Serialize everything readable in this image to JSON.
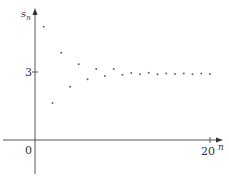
{
  "chart_data": {
    "type": "scatter",
    "title": "",
    "xlabel": "n",
    "ylabel": "s_n",
    "ylabel_main": "s",
    "ylabel_sub": "n",
    "x_ticks": [
      {
        "value": 0,
        "label": "0"
      },
      {
        "value": 20,
        "label": "20"
      }
    ],
    "y_ticks": [
      {
        "value": 3,
        "label": "3"
      }
    ],
    "xlim": [
      0,
      21
    ],
    "ylim": [
      -1.5,
      5.6
    ],
    "grid": false,
    "legend": null,
    "x": [
      1,
      2,
      3,
      4,
      5,
      6,
      7,
      8,
      9,
      10,
      11,
      12,
      13,
      14,
      15,
      16,
      17,
      18,
      19,
      20
    ],
    "values": [
      5.0,
      1.63,
      3.85,
      2.35,
      3.34,
      2.68,
      3.13,
      2.82,
      3.13,
      2.88,
      2.96,
      2.9,
      2.97,
      2.9,
      2.93,
      2.91,
      2.93,
      2.9,
      2.93,
      2.91
    ],
    "colors": {
      "axis": "#555555",
      "points": "#666666",
      "text": "#333333"
    }
  }
}
